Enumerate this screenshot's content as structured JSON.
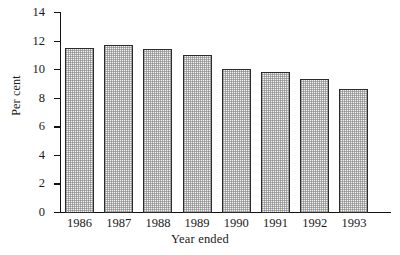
{
  "chart_data": {
    "type": "bar",
    "title": "",
    "xlabel": "Year ended",
    "ylabel": "Per cent",
    "categories": [
      "1986",
      "1987",
      "1988",
      "1989",
      "1990",
      "1991",
      "1992",
      "1993"
    ],
    "values": [
      11.6,
      11.8,
      11.5,
      11.1,
      10.1,
      9.9,
      9.4,
      8.7
    ],
    "ylim": [
      0,
      14
    ],
    "yticks": [
      0,
      2,
      4,
      6,
      8,
      10,
      12,
      14
    ],
    "ytick_labels": [
      "0",
      "2",
      "4",
      "6",
      "8",
      "10",
      "12",
      "14"
    ],
    "grid": false,
    "legend": null,
    "bar_fill": "#f2f2f2",
    "bar_edge": "#2b2b2b",
    "axis_color": "#111111",
    "background": "#ffffff"
  }
}
